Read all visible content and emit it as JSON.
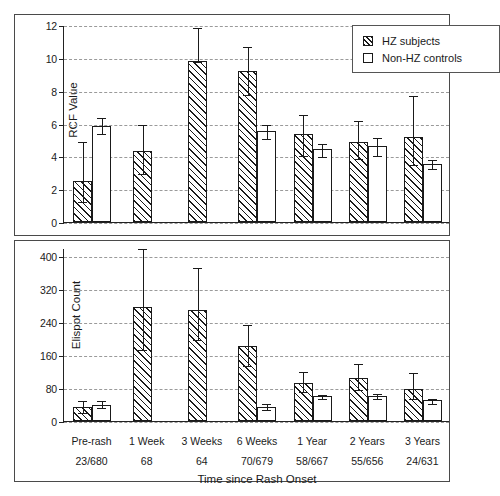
{
  "chart_data": [
    {
      "id": "rcf-panel",
      "type": "bar",
      "title": "",
      "xlabel": "",
      "ylabel": "RCF Value",
      "ylim": [
        0,
        12
      ],
      "yticks": [
        0,
        2,
        4,
        6,
        8,
        10,
        12
      ],
      "grid": true,
      "legend": {
        "position": "top-right",
        "entries": [
          "HZ subjects",
          "Non-HZ controls"
        ]
      },
      "categories": [
        "Pre-rash",
        "1 Week",
        "3 Weeks",
        "6 Weeks",
        "1 Year",
        "2 Years",
        "3 Years"
      ],
      "series": [
        {
          "name": "HZ subjects",
          "fill": "hatched",
          "values": [
            2.5,
            4.3,
            9.8,
            9.2,
            5.35,
            4.9,
            5.2
          ],
          "err_low": [
            1.25,
            3.0,
            9.8,
            7.8,
            4.1,
            3.9,
            3.55
          ],
          "err_high": [
            4.95,
            6.0,
            11.9,
            10.75,
            6.6,
            6.2,
            7.75
          ]
        },
        {
          "name": "Non-HZ controls",
          "fill": "white",
          "values": [
            5.85,
            null,
            null,
            5.55,
            4.45,
            4.65,
            3.55
          ],
          "err_low": [
            5.4,
            null,
            null,
            5.1,
            4.05,
            4.1,
            3.3
          ],
          "err_high": [
            6.4,
            null,
            null,
            6.0,
            4.8,
            5.2,
            3.85
          ]
        }
      ]
    },
    {
      "id": "elispot-panel",
      "type": "bar",
      "title": "",
      "xlabel": "Time since Rash Onset",
      "ylabel": "Elispot Count",
      "ylim": [
        0,
        420
      ],
      "yticks": [
        0,
        80,
        160,
        240,
        320,
        400
      ],
      "grid": true,
      "categories": [
        "Pre-rash",
        "1 Week",
        "3 Weeks",
        "6 Weeks",
        "1 Year",
        "2 Years",
        "3 Years"
      ],
      "sample_sizes": [
        "23/680",
        "68",
        "64",
        "70/679",
        "58/667",
        "55/656",
        "24/631"
      ],
      "series": [
        {
          "name": "HZ subjects",
          "fill": "hatched",
          "values": [
            33,
            277,
            270,
            182,
            93,
            105,
            78
          ],
          "err_low": [
            22,
            175,
            199,
            135,
            73,
            77,
            55
          ],
          "err_high": [
            51,
            420,
            375,
            236,
            121,
            142,
            120
          ]
        },
        {
          "name": "Non-HZ controls",
          "fill": "white",
          "values": [
            40,
            null,
            null,
            35,
            61,
            61,
            50
          ],
          "err_low": [
            33,
            null,
            null,
            28,
            56,
            55,
            44
          ],
          "err_high": [
            50,
            null,
            null,
            43,
            66,
            68,
            57
          ]
        }
      ]
    }
  ],
  "top_panel": {
    "y_axis_title": "RCF Value",
    "y_tick_labels": [
      "0",
      "2",
      "4",
      "6",
      "8",
      "10",
      "12"
    ],
    "legend": {
      "hz_label": "HZ subjects",
      "control_label": "Non-HZ controls"
    }
  },
  "bottom_panel": {
    "y_axis_title": "Elispot Count",
    "y_tick_labels": [
      "0",
      "80",
      "160",
      "240",
      "320",
      "400"
    ],
    "x_axis_title": "Time since Rash Onset",
    "category_labels": [
      "Pre-rash",
      "1 Week",
      "3 Weeks",
      "6 Weeks",
      "1 Year",
      "2 Years",
      "3 Years"
    ],
    "sample_size_labels": [
      "23/680",
      "68",
      "64",
      "70/679",
      "58/667",
      "55/656",
      "24/631"
    ]
  },
  "colors": {
    "ink": "#1a1a1a",
    "frame": "#4a4a4a",
    "grid": "#9a9a9a",
    "background": "#ffffff"
  }
}
